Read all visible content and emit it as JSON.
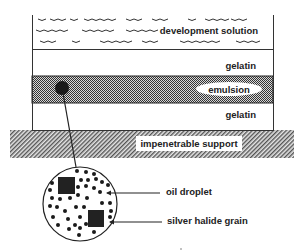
{
  "diagram": {
    "layers": [
      {
        "id": "development-solution",
        "label": "development solution"
      },
      {
        "id": "gelatin-top",
        "label": "gelatin"
      },
      {
        "id": "emulsion",
        "label": "emulsion"
      },
      {
        "id": "gelatin-bottom",
        "label": "gelatin"
      },
      {
        "id": "support",
        "label": "impenetrable support"
      }
    ],
    "callouts": [
      {
        "id": "oil-droplet",
        "label": "oil droplet"
      },
      {
        "id": "silver-halide-grain",
        "label": "silver halide grain"
      }
    ],
    "colors": {
      "ink": "#222222",
      "emulsion_fill": "#555555",
      "support_fill": "#888888"
    }
  }
}
